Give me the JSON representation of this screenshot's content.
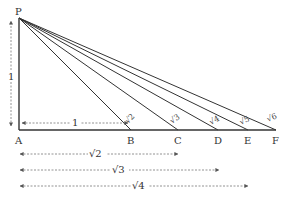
{
  "diagram": {
    "title": "",
    "points": {
      "P": {
        "label": "P",
        "x": 19,
        "y": 18
      },
      "A": {
        "label": "A",
        "x": 19,
        "y": 130
      },
      "B": {
        "label": "B",
        "x": 131,
        "y": 130
      },
      "C": {
        "label": "C",
        "x": 178,
        "y": 130
      },
      "D": {
        "label": "D",
        "x": 218,
        "y": 130
      },
      "E": {
        "label": "E",
        "x": 248,
        "y": 130
      },
      "F": {
        "label": "F",
        "x": 276,
        "y": 130
      }
    },
    "hypotenuse_labels": {
      "PB": "√2",
      "PC": "√3",
      "PD": "√4",
      "PE": "√5",
      "PF": "√6"
    },
    "vertical_measure": {
      "label": "1"
    },
    "horizontal_measures": [
      {
        "label": "1",
        "from": "A",
        "to": "B"
      },
      {
        "label": "√2",
        "from": "A",
        "to": "C"
      },
      {
        "label": "√3",
        "from": "A",
        "to": "D"
      },
      {
        "label": "√4",
        "from": "A",
        "to": "E"
      }
    ],
    "colors": {
      "line": "#333333",
      "dashed": "#777777"
    }
  }
}
